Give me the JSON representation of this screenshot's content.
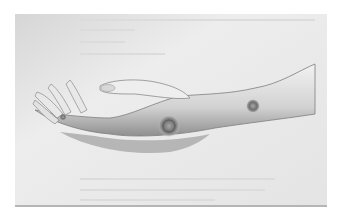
{
  "image": {
    "subject": "Engraved illustration of an outstretched hand and forearm with raised circular lesions",
    "colors": {
      "background": "#ffffff",
      "plate": "#e9e9e9",
      "plate_edge": "#bdbdbd",
      "skin_light": "#eeeeee",
      "skin_mid": "#c8c8c8",
      "skin_shadow": "#8c8c8c",
      "lesion": "#7a7a7a"
    }
  }
}
